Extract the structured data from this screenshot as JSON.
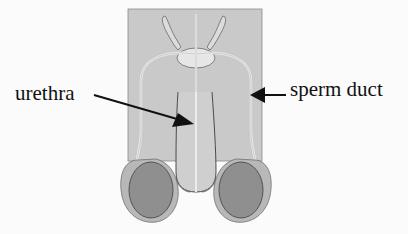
{
  "diagram": {
    "labels": [
      {
        "id": "urethra",
        "text": "urethra",
        "points_to": "urethra"
      },
      {
        "id": "sperm_duct",
        "text": "sperm duct",
        "points_to": "sperm duct"
      }
    ],
    "colors": {
      "body_fill": "#c9c9c9",
      "duct_line": "#ececec",
      "testis_outer": "#b4b4b4",
      "testis_inner": "#8f8f8f",
      "outline": "#555555",
      "arrow": "#111111",
      "text": "#111111",
      "background": "#fbfbfb"
    }
  }
}
